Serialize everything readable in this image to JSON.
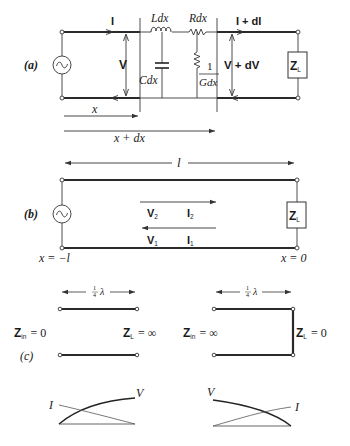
{
  "figure": {
    "panel_a": {
      "label": "(a)",
      "current_in": "I",
      "current_out": "I + dI",
      "voltage_in": "V",
      "voltage_out": "V + dV",
      "inductor": "Ldx",
      "resistor_series": "Rdx",
      "capacitor": "Cdx",
      "conductance_num": "1",
      "conductance_den": "Gdx",
      "load": "Z",
      "load_sub": "L",
      "pos_x": "x",
      "pos_x_dx": "x + dx"
    },
    "panel_b": {
      "label": "(b)",
      "length": "l",
      "wave_forward_v": "V",
      "wave_forward_v_sub": "2",
      "wave_forward_i": "I",
      "wave_forward_i_sub": "2",
      "wave_back_v": "V",
      "wave_back_v_sub": "1",
      "wave_back_i": "I",
      "wave_back_i_sub": "1",
      "load": "Z",
      "load_sub": "L",
      "left_pos": "x = −l",
      "right_pos": "x = 0"
    },
    "panel_c": {
      "label": "(c)",
      "left": {
        "length_num": "1",
        "length_den": "4",
        "length_sym": "λ",
        "zin": "Z",
        "zin_sub": "in",
        "zin_val": "= 0",
        "zl": "Z",
        "zl_sub": "L",
        "zl_val": "= ∞"
      },
      "right": {
        "length_num": "1",
        "length_den": "4",
        "length_sym": "λ",
        "zin": "Z",
        "zin_sub": "in",
        "zin_val": "= ∞",
        "zl": "Z",
        "zl_sub": "L",
        "zl_val": "= 0"
      }
    },
    "standing_waves": {
      "left": {
        "i_label": "I",
        "v_label": "V"
      },
      "right": {
        "i_label": "I",
        "v_label": "V"
      }
    }
  }
}
